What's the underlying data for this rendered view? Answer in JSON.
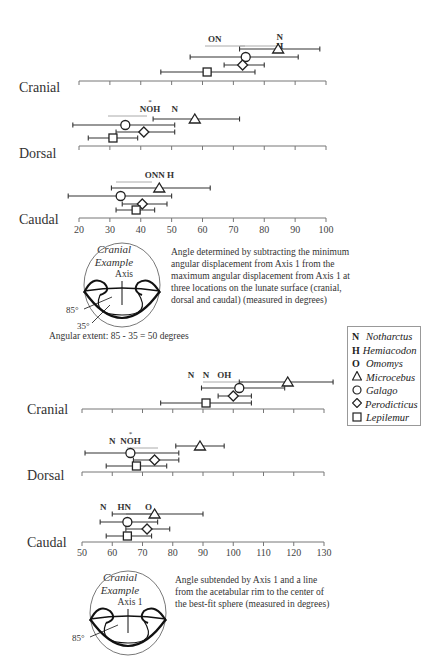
{
  "legend": {
    "items": [
      {
        "symbol": "N",
        "symbol_type": "letter",
        "name": "Notharctus"
      },
      {
        "symbol": "H",
        "symbol_type": "letter",
        "name": "Hemiacodon"
      },
      {
        "symbol": "O",
        "symbol_type": "letter",
        "name": "Omomys"
      },
      {
        "symbol": "triangle",
        "symbol_type": "shape",
        "name": "Microcebus"
      },
      {
        "symbol": "circle",
        "symbol_type": "shape",
        "name": "Galago"
      },
      {
        "symbol": "diamond",
        "symbol_type": "shape",
        "name": "Perodicticus"
      },
      {
        "symbol": "square",
        "symbol_type": "shape",
        "name": "Lepilemur"
      }
    ]
  },
  "top_panel": {
    "caption": "Angle determined by subtracting the minimum angular displacement from Axis 1 from the maximum angular displacement from Axis 1 at three locations on the lunate surface (cranial, dorsal and caudal) (measured in degrees)",
    "diagram": {
      "title_line1": "Cranial",
      "title_line2": "Example",
      "axis_label": "Axis",
      "angle1": "85°",
      "angle2": "35°"
    },
    "extent_note": "Angular extent: 85 - 35 = 50 degrees"
  },
  "bottom_panel": {
    "caption": "Angle subtended by Axis 1 and a line from the acetabular rim to the center of the best-fit sphere (measured in degrees)",
    "diagram": {
      "title_line1": "Cranial",
      "title_line2": "Example",
      "axis_label": "Axis 1",
      "angle1": "85°"
    }
  },
  "chart_data": [
    {
      "type": "errorbar",
      "title": "Angular extent (degrees)",
      "xlabel": "",
      "ylabel": "",
      "xlim": [
        20,
        100
      ],
      "ticks": [
        20,
        30,
        40,
        50,
        60,
        70,
        80,
        90,
        100
      ],
      "grid": false,
      "legend_position": "right",
      "groups": [
        {
          "name": "Cranial",
          "series": [
            {
              "taxon": "Microcebus",
              "marker": "triangle",
              "mean": 84.5,
              "min": 72,
              "max": 98
            },
            {
              "taxon": "Galago",
              "marker": "circle",
              "mean": 74,
              "min": 56,
              "max": 91
            },
            {
              "taxon": "Perodicticus",
              "marker": "diamond",
              "mean": 73,
              "min": 67,
              "max": 80
            },
            {
              "taxon": "Lepilemur",
              "marker": "square",
              "mean": 61.5,
              "min": 46.5,
              "max": 77
            }
          ],
          "fossil_labels": [
            {
              "text": "ON",
              "value": 64
            },
            {
              "text": "N",
              "value": 85,
              "stack": "H"
            }
          ]
        },
        {
          "name": "Dorsal",
          "series": [
            {
              "taxon": "Microcebus",
              "marker": "triangle",
              "mean": 57.5,
              "min": 44,
              "max": 72
            },
            {
              "taxon": "Galago",
              "marker": "circle",
              "mean": 35,
              "min": 18,
              "max": 51
            },
            {
              "taxon": "Perodicticus",
              "marker": "diamond",
              "mean": 41,
              "min": 32,
              "max": 51
            },
            {
              "taxon": "Lepilemur",
              "marker": "square",
              "mean": 31,
              "min": 23,
              "max": 39
            }
          ],
          "fossil_labels": [
            {
              "text": "NOH",
              "value": 43,
              "note": "asterisk above O"
            },
            {
              "text": "N",
              "value": 51
            }
          ]
        },
        {
          "name": "Caudal",
          "series": [
            {
              "taxon": "Microcebus",
              "marker": "triangle",
              "mean": 46,
              "min": 30.5,
              "max": 62.5
            },
            {
              "taxon": "Galago",
              "marker": "circle",
              "mean": 33.5,
              "min": 16.5,
              "max": 50
            },
            {
              "taxon": "Perodicticus",
              "marker": "diamond",
              "mean": 40.5,
              "min": 34,
              "max": 48.5
            },
            {
              "taxon": "Lepilemur",
              "marker": "square",
              "mean": 38.5,
              "min": 32,
              "max": 44.5
            }
          ],
          "fossil_labels": [
            {
              "text": "ONN H",
              "value": 46
            }
          ]
        }
      ]
    },
    {
      "type": "errorbar",
      "title": "Angle subtended by Axis 1 and rim line (degrees)",
      "xlabel": "",
      "ylabel": "",
      "xlim": [
        50,
        130
      ],
      "ticks": [
        50,
        60,
        70,
        80,
        90,
        100,
        110,
        120,
        130
      ],
      "grid": false,
      "legend_position": "right",
      "groups": [
        {
          "name": "Cranial",
          "series": [
            {
              "taxon": "Microcebus",
              "marker": "triangle",
              "mean": 118,
              "min": 102,
              "max": 133
            },
            {
              "taxon": "Galago",
              "marker": "circle",
              "mean": 102,
              "min": 89.5,
              "max": 117
            },
            {
              "taxon": "Perodicticus",
              "marker": "diamond",
              "mean": 100,
              "min": 95,
              "max": 106
            },
            {
              "taxon": "Lepilemur",
              "marker": "square",
              "mean": 91,
              "min": 76,
              "max": 106
            }
          ],
          "fossil_labels": [
            {
              "text": "N",
              "value": 86
            },
            {
              "text": "N",
              "value": 91
            },
            {
              "text": "OH",
              "value": 97
            }
          ]
        },
        {
          "name": "Dorsal",
          "series": [
            {
              "taxon": "Microcebus",
              "marker": "triangle",
              "mean": 89,
              "min": 81,
              "max": 97
            },
            {
              "taxon": "Galago",
              "marker": "circle",
              "mean": 66,
              "min": 51,
              "max": 82
            },
            {
              "taxon": "Perodicticus",
              "marker": "diamond",
              "mean": 74,
              "min": 67,
              "max": 82
            },
            {
              "taxon": "Lepilemur",
              "marker": "square",
              "mean": 68,
              "min": 58,
              "max": 78
            }
          ],
          "fossil_labels": [
            {
              "text": "N",
              "value": 60
            },
            {
              "text": "NOH",
              "value": 66,
              "note": "asterisk above O"
            }
          ]
        },
        {
          "name": "Caudal",
          "series": [
            {
              "taxon": "Microcebus",
              "marker": "triangle",
              "mean": 74,
              "min": 60,
              "max": 90
            },
            {
              "taxon": "Galago",
              "marker": "circle",
              "mean": 65,
              "min": 56,
              "max": 75
            },
            {
              "taxon": "Perodicticus",
              "marker": "diamond",
              "mean": 71.5,
              "min": 64.5,
              "max": 79
            },
            {
              "taxon": "Lepilemur",
              "marker": "square",
              "mean": 65,
              "min": 58,
              "max": 73
            }
          ],
          "fossil_labels": [
            {
              "text": "N",
              "value": 57
            },
            {
              "text": "HN",
              "value": 64
            },
            {
              "text": "O",
              "value": 72
            }
          ]
        }
      ]
    }
  ]
}
